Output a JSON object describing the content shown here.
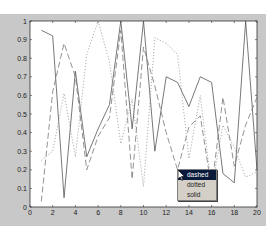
{
  "figure": {
    "background": "#c8c8c8",
    "axes_background": "#ffffff",
    "line_color": "#555555"
  },
  "context_menu": {
    "items": [
      {
        "label": "dashed",
        "highlighted": true
      },
      {
        "label": "dotted",
        "highlighted": false
      },
      {
        "label": "solid",
        "highlighted": false
      }
    ]
  },
  "chart_data": {
    "type": "line",
    "title": "",
    "xlabel": "",
    "ylabel": "",
    "xlim": [
      0,
      20
    ],
    "ylim": [
      0,
      1
    ],
    "grid": false,
    "legend": null,
    "x_ticks": [
      "0",
      "2",
      "4",
      "6",
      "8",
      "10",
      "12",
      "14",
      "16",
      "18",
      "20"
    ],
    "y_ticks": [
      "0",
      "0.1",
      "0.2",
      "0.3",
      "0.4",
      "0.5",
      "0.6",
      "0.7",
      "0.8",
      "0.9",
      "1"
    ],
    "x": [
      1,
      2,
      3,
      4,
      5,
      6,
      7,
      8,
      9,
      10,
      11,
      12,
      13,
      14,
      15,
      16,
      17,
      18,
      19,
      20
    ],
    "series": [
      {
        "name": "solid",
        "style": "solid",
        "values": [
          0.95,
          0.92,
          0.05,
          0.73,
          0.27,
          0.42,
          0.55,
          1.0,
          0.42,
          1.0,
          0.3,
          0.7,
          0.67,
          0.54,
          0.7,
          0.67,
          0.18,
          0.13,
          1.0,
          0.2
        ]
      },
      {
        "name": "dashed",
        "style": "dashed",
        "values": [
          0.03,
          0.62,
          0.88,
          0.7,
          0.2,
          0.38,
          0.48,
          0.95,
          0.15,
          0.86,
          0.65,
          0.4,
          0.2,
          0.43,
          0.49,
          0.1,
          0.59,
          0.22,
          0.44,
          0.59
        ]
      },
      {
        "name": "dotted",
        "style": "dotted",
        "values": [
          0.25,
          0.3,
          0.61,
          0.27,
          0.82,
          1.0,
          0.78,
          0.34,
          0.58,
          0.11,
          0.91,
          0.88,
          0.82,
          0.26,
          0.6,
          0.1,
          0.44,
          0.32,
          0.16,
          0.19
        ]
      }
    ]
  }
}
